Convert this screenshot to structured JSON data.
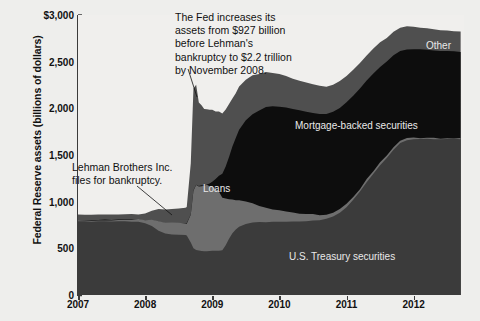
{
  "chart_data": {
    "type": "area",
    "title": "",
    "xlabel": "",
    "ylabel": "Federal Reserve assets (billions of dollars)",
    "ylim": [
      0,
      3000
    ],
    "xlim": [
      2007.0,
      2012.75
    ],
    "yticks": [
      "0",
      "500",
      "1,000",
      "1,500",
      "2,000",
      "2,500",
      "$3,000"
    ],
    "ytick_values": [
      0,
      500,
      1000,
      1500,
      2000,
      2500,
      3000
    ],
    "xticks": [
      "2007",
      "2008",
      "2009",
      "2010",
      "2011",
      "2012"
    ],
    "xtick_values": [
      2007,
      2008,
      2009,
      2010,
      2011,
      2012
    ],
    "grid": false,
    "legend_position": "inline-labels",
    "stacked": true,
    "x": [
      2007.0,
      2007.1,
      2007.2,
      2007.3,
      2007.4,
      2007.5,
      2007.6,
      2007.7,
      2007.8,
      2007.9,
      2008.0,
      2008.1,
      2008.2,
      2008.3,
      2008.4,
      2008.5,
      2008.6,
      2008.62,
      2008.68,
      2008.72,
      2008.76,
      2008.8,
      2008.84,
      2008.88,
      2008.92,
      2008.96,
      2009.0,
      2009.05,
      2009.1,
      2009.15,
      2009.2,
      2009.25,
      2009.3,
      2009.35,
      2009.4,
      2009.5,
      2009.6,
      2009.7,
      2009.8,
      2009.9,
      2010.0,
      2010.1,
      2010.2,
      2010.3,
      2010.4,
      2010.5,
      2010.6,
      2010.7,
      2010.8,
      2010.9,
      2011.0,
      2011.1,
      2011.2,
      2011.3,
      2011.4,
      2011.5,
      2011.6,
      2011.7,
      2011.8,
      2011.9,
      2012.0,
      2012.1,
      2012.2,
      2012.3,
      2012.4,
      2012.5,
      2012.6,
      2012.7
    ],
    "series": [
      {
        "name": "U.S. Treasury securities",
        "color": "#3b3b3b",
        "values": [
          790,
          788,
          785,
          788,
          790,
          785,
          788,
          790,
          788,
          785,
          770,
          740,
          690,
          660,
          650,
          645,
          640,
          635,
          560,
          500,
          480,
          475,
          470,
          470,
          472,
          474,
          475,
          476,
          478,
          480,
          530,
          600,
          660,
          700,
          730,
          760,
          775,
          780,
          782,
          785,
          785,
          786,
          788,
          790,
          792,
          795,
          800,
          815,
          840,
          880,
          940,
          1020,
          1110,
          1210,
          1300,
          1390,
          1470,
          1560,
          1630,
          1660,
          1668,
          1670,
          1672,
          1670,
          1668,
          1670,
          1672,
          1670
        ]
      },
      {
        "name": "Loans",
        "color": "#6e6e6e",
        "values": [
          10,
          11,
          12,
          14,
          15,
          16,
          18,
          20,
          22,
          24,
          30,
          60,
          95,
          110,
          120,
          125,
          130,
          135,
          300,
          620,
          700,
          690,
          705,
          695,
          700,
          690,
          680,
          660,
          620,
          560,
          500,
          430,
          370,
          320,
          290,
          250,
          210,
          175,
          150,
          130,
          115,
          100,
          90,
          80,
          72,
          65,
          58,
          52,
          46,
          42,
          38,
          34,
          30,
          28,
          26,
          24,
          22,
          20,
          18,
          17,
          16,
          15,
          14,
          14,
          13,
          13,
          12,
          12
        ]
      },
      {
        "name": "Mortgage-backed securities",
        "color": "#0d0d0d",
        "values": [
          0,
          0,
          0,
          0,
          0,
          0,
          0,
          0,
          0,
          0,
          0,
          0,
          0,
          0,
          0,
          0,
          0,
          0,
          0,
          0,
          0,
          0,
          0,
          5,
          15,
          30,
          60,
          110,
          180,
          260,
          350,
          450,
          560,
          660,
          750,
          860,
          950,
          1020,
          1080,
          1110,
          1120,
          1125,
          1118,
          1110,
          1100,
          1090,
          1080,
          1070,
          1075,
          1080,
          1085,
          1080,
          1070,
          1060,
          1050,
          1030,
          1010,
          990,
          970,
          955,
          950,
          945,
          940,
          935,
          930,
          928,
          925,
          920
        ]
      },
      {
        "name": "Other",
        "color": "#4f4f4f",
        "values": [
          60,
          58,
          60,
          62,
          60,
          62,
          60,
          62,
          60,
          62,
          70,
          95,
          130,
          145,
          150,
          155,
          160,
          170,
          560,
          1100,
          1080,
          900,
          860,
          830,
          810,
          790,
          760,
          720,
          680,
          640,
          600,
          560,
          520,
          490,
          470,
          440,
          420,
          400,
          380,
          360,
          345,
          330,
          320,
          315,
          310,
          305,
          300,
          300,
          298,
          295,
          290,
          285,
          280,
          272,
          265,
          258,
          250,
          245,
          240,
          238,
          236,
          234,
          232,
          230,
          228,
          226,
          224,
          222
        ]
      }
    ],
    "annotations": [
      {
        "id": "fed-assets-note",
        "text": "The Fed increases its\nassets from  $927 billion\nbefore Lehman's\nbankruptcy to $2.2 trillion\nby November 2008.",
        "x_px": 175,
        "y_px": 11,
        "leader": [
          [
            188,
            69
          ],
          [
            197,
            97
          ]
        ]
      },
      {
        "id": "lehman-note",
        "text": "Lehman Brothers Inc.\nfiles for bankruptcy.",
        "x_px": 72,
        "y_px": 161,
        "leader": [
          [
            137,
            186
          ],
          [
            172,
            215
          ]
        ]
      }
    ],
    "series_labels": [
      {
        "name": "Loans",
        "x_px": 203,
        "y_px": 183
      },
      {
        "name": "Mortgage-backed securities",
        "x_px": 295,
        "y_px": 120
      },
      {
        "name": "Other",
        "x_px": 426,
        "y_px": 40
      },
      {
        "name": "U.S. Treasury securities",
        "x_px": 289,
        "y_px": 251
      }
    ]
  },
  "colors": {
    "background": "#eeeeec",
    "plot_background": "#f0efed",
    "axis": "#3b3b3b",
    "text": "#111111",
    "label_text": "#e9e9e9",
    "treasury": "#3b3b3b",
    "loans": "#6e6e6e",
    "mbs": "#0d0d0d",
    "other": "#4f4f4f"
  }
}
